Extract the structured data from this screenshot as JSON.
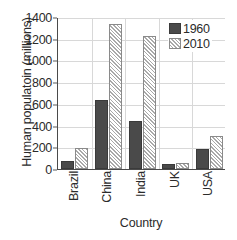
{
  "chart_data": {
    "type": "bar",
    "title": "",
    "xlabel": "Country",
    "ylabel": "Human populatoin (millions)",
    "categories": [
      "Brazil",
      "China",
      "India",
      "UK",
      "USA"
    ],
    "series": [
      {
        "name": "1960",
        "values": [
          70,
          640,
          445,
          45,
          180
        ],
        "color": "#4a4a4a",
        "pattern": "solid"
      },
      {
        "name": "2010",
        "values": [
          195,
          1335,
          1225,
          55,
          300
        ],
        "color": "#ffffff",
        "pattern": "diagonal-hatch"
      }
    ],
    "ylim": [
      0,
      1400
    ],
    "ytick_labels": [
      "0",
      "200",
      "400",
      "600",
      "800",
      "1000",
      "1200",
      "1400"
    ],
    "ytick_values": [
      0,
      200,
      400,
      600,
      800,
      1000,
      1200,
      1400
    ],
    "grid": "horizontal-and-vertical",
    "legend_position": "top-right",
    "legend_entries": [
      "1960",
      "2010"
    ]
  }
}
